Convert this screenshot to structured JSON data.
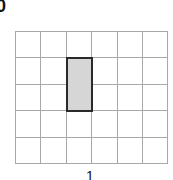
{
  "figure": {
    "top_label": "0",
    "bottom_label": "1",
    "grid": {
      "columns": 6,
      "rows": 5,
      "line_color": "#a8a8a8"
    },
    "highlight": {
      "column": 3,
      "row_start": 2,
      "row_end": 3,
      "fill": "#d6d6d6",
      "border": "#2a2a2a"
    }
  }
}
